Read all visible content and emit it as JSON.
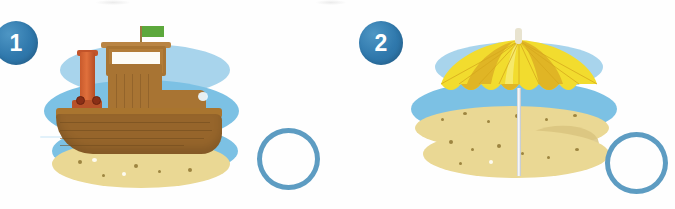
{
  "worksheet": {
    "title": "Picture matching exercise",
    "background_color": "#ffffff",
    "item_count": 2
  },
  "palette": {
    "badge_blue": "#2f78ac",
    "badge_text": "#ffffff",
    "sky_blue": "#a8d4ec",
    "sea_blue": "#7cc1e4",
    "sand_yellow": "#ead894",
    "sand_shadow": "#d9c47f",
    "pebble_dark": "#9d8540",
    "pebble_light": "#fdfbf0",
    "circle_stroke": "#5d9cc2",
    "boat_wood": "#96652b",
    "boat_wood_light": "#b37d38",
    "funnel_orange": "#d4612f",
    "porthole_red": "#8a2f16",
    "flag_green": "#5ca83c",
    "umbrella_yellow": "#f2dc2e",
    "umbrella_gold": "#e0b525",
    "pole_white": "#ffffff"
  },
  "items": [
    {
      "number": "1",
      "picture_name": "tugboat-on-water",
      "description": "Wooden tugboat with orange smokestack and green flag floating on blue water near a sandy shore",
      "answer_circle": {
        "name": "answer-circle-1",
        "state": "empty",
        "label": ""
      }
    },
    {
      "number": "2",
      "picture_name": "beach-umbrella-on-sand",
      "description": "Yellow and gold striped beach umbrella with white pole standing on sand beside blue water",
      "answer_circle": {
        "name": "answer-circle-2",
        "state": "empty",
        "label": ""
      }
    }
  ]
}
